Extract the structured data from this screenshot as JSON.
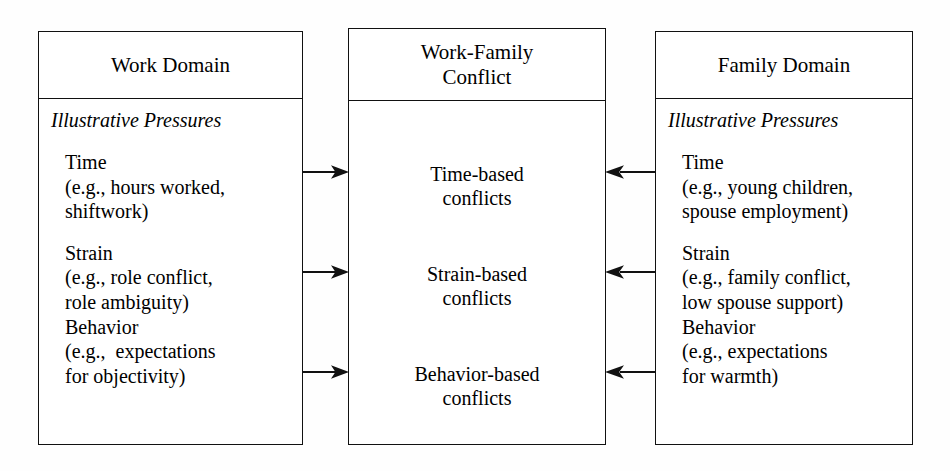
{
  "diagram": {
    "stroke_color": "#111111",
    "background_color": "#fefefe"
  },
  "work_domain": {
    "header": "Work Domain",
    "pressures_label": "Illustrative Pressures",
    "pressures": [
      {
        "name": "Time",
        "example_line1": "(e.g., hours worked,",
        "example_line2": "shiftwork)"
      },
      {
        "name": "Strain",
        "example_line1": "(e.g., role conflict,",
        "example_line2": "role ambiguity)"
      },
      {
        "name": "Behavior",
        "example_line1": "(e.g.,  expectations",
        "example_line2": "for objectivity)"
      }
    ]
  },
  "conflict": {
    "header_line1": "Work-Family",
    "header_line2": "Conflict",
    "items": [
      {
        "line1": "Time-based",
        "line2": "conflicts"
      },
      {
        "line1": "Strain-based",
        "line2": "conflicts"
      },
      {
        "line1": "Behavior-based",
        "line2": "conflicts"
      }
    ]
  },
  "family_domain": {
    "header": "Family Domain",
    "pressures_label": "Illustrative Pressures",
    "pressures": [
      {
        "name": "Time",
        "example_line1": "(e.g., young children,",
        "example_line2": "spouse employment)"
      },
      {
        "name": "Strain",
        "example_line1": "(e.g., family conflict,",
        "example_line2": "low spouse support)"
      },
      {
        "name": "Behavior",
        "example_line1": "(e.g., expectations",
        "example_line2": "for warmth)"
      }
    ]
  },
  "arrows": {
    "left_direction": "points-right",
    "right_direction": "points-left",
    "count_per_side": 3
  }
}
